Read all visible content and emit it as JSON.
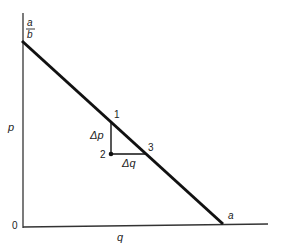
{
  "diagram": {
    "type": "linear demand curve",
    "axes": {
      "y_label": "p",
      "x_label": "q",
      "origin_label": "0"
    },
    "intercepts": {
      "y_intercept_num": "a",
      "y_intercept_den": "b",
      "x_intercept": "a"
    },
    "points": [
      {
        "label": "1"
      },
      {
        "label": "2"
      },
      {
        "label": "3"
      }
    ],
    "deltas": {
      "vertical": "Δp",
      "horizontal": "Δq"
    },
    "colors": {
      "line": "#111111",
      "axis": "#333333",
      "background": "#ffffff"
    }
  }
}
